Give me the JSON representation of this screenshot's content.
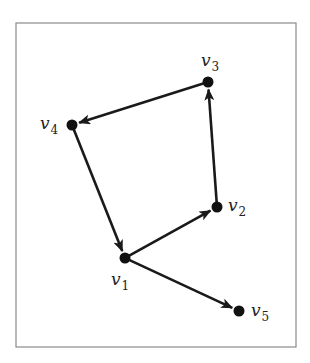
{
  "diagram": {
    "type": "directed-graph",
    "frame": {
      "x": 16,
      "y": 23,
      "width": 280,
      "height": 324,
      "stroke": "#8a8a8a"
    },
    "style": {
      "edge_color": "#1a1a1a",
      "node_color": "#111111",
      "node_radius": 5.5
    },
    "nodes": [
      {
        "id": "v1",
        "name": "v",
        "sub": "1",
        "x": 125,
        "y": 258,
        "label_x": 111,
        "label_y": 285
      },
      {
        "id": "v2",
        "name": "v",
        "sub": "2",
        "x": 217,
        "y": 207,
        "label_x": 228,
        "label_y": 211
      },
      {
        "id": "v3",
        "name": "v",
        "sub": "3",
        "x": 208,
        "y": 82,
        "label_x": 201,
        "label_y": 66
      },
      {
        "id": "v4",
        "name": "v",
        "sub": "4",
        "x": 72,
        "y": 125,
        "label_x": 40,
        "label_y": 129
      },
      {
        "id": "v5",
        "name": "v",
        "sub": "5",
        "x": 239,
        "y": 311,
        "label_x": 251,
        "label_y": 316
      }
    ],
    "edges": [
      {
        "from": "v1",
        "to": "v2"
      },
      {
        "from": "v2",
        "to": "v3"
      },
      {
        "from": "v3",
        "to": "v4"
      },
      {
        "from": "v4",
        "to": "v1"
      },
      {
        "from": "v1",
        "to": "v5"
      }
    ]
  }
}
